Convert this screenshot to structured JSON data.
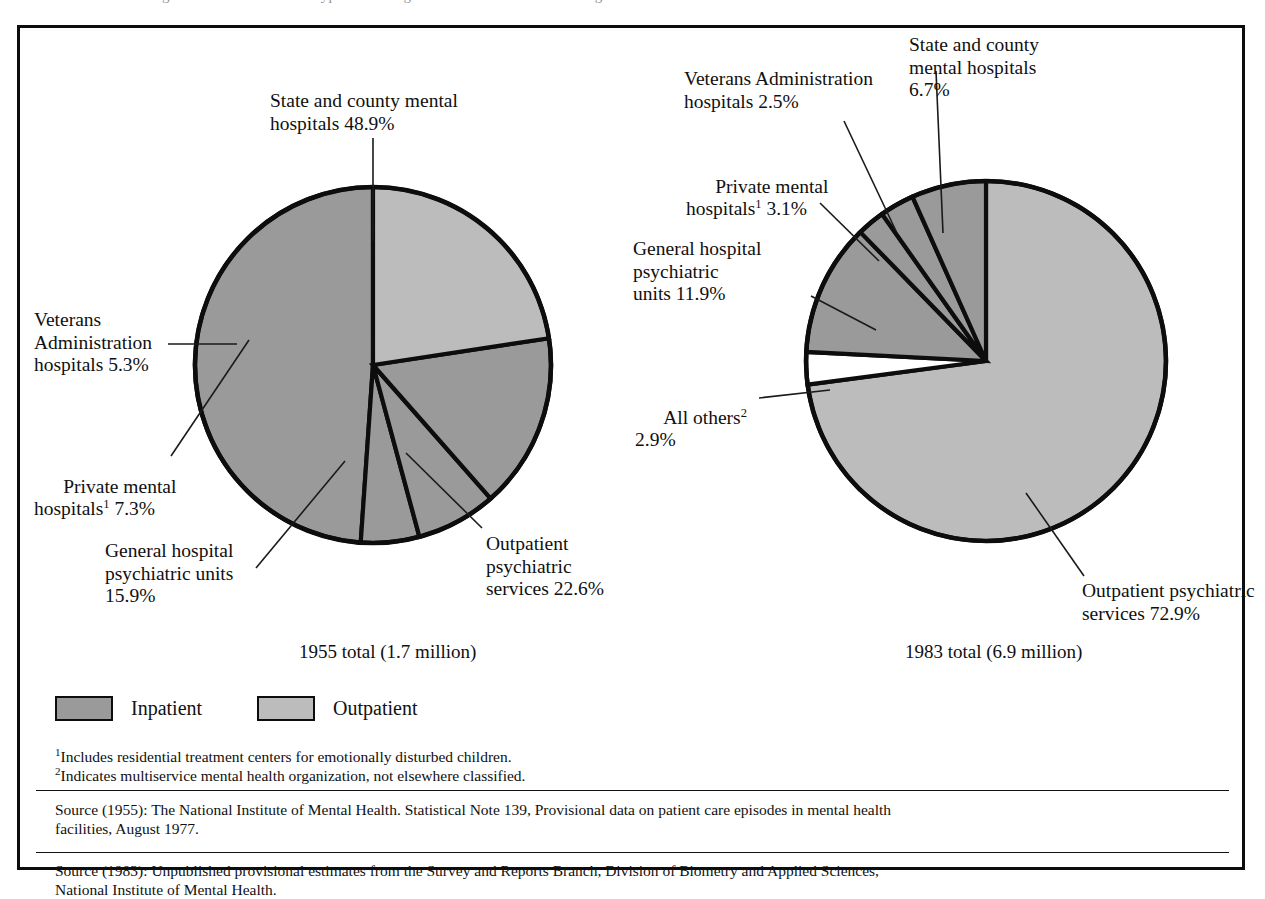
{
  "top_cut_text": "the most dramatic changes have occurred in the types of settings where mental health care is given.",
  "colors": {
    "inpatient": "#9a9a9a",
    "outpatient": "#bcbcbc",
    "other_white": "#ffffff",
    "outline": "#0d0d0d"
  },
  "legend": {
    "items": [
      {
        "label": "Inpatient",
        "swatch": "#9a9a9a"
      },
      {
        "label": "Outpatient",
        "swatch": "#bcbcbc"
      }
    ]
  },
  "totals": {
    "left": "1955 total (1.7 million)",
    "right": "1983 total (6.9 million)"
  },
  "labels_1955": {
    "state_county": "State and county mental\nhospitals 48.9%",
    "veterans": "Veterans\nAdministration\nhospitals 5.3%",
    "private_1": "Private mental\nhospitals",
    "private_2": " 7.3%",
    "general": "General hospital\npsychiatric units\n15.9%",
    "outpatient": "Outpatient\npsychiatric\nservices 22.6%"
  },
  "labels_1983": {
    "state_county": "State and county\nmental hospitals\n6.7%",
    "veterans": "Veterans Administration\nhospitals 2.5%",
    "private_1": "Private mental\nhospitals",
    "private_2": " 3.1%",
    "general": "General hospital\npsychiatric\nunits 11.9%",
    "all_others_1": "All others",
    "all_others_2": "\n2.9%",
    "outpatient": "Outpatient psychiatric\nservices 72.9%"
  },
  "footnotes": {
    "sup1": "1",
    "note1": "Includes residential treatment centers for emotionally disturbed children.",
    "sup2": "2",
    "note2": "Indicates multiservice mental health organization, not elsewhere classified."
  },
  "sources": {
    "s1_line1": "Source (1955):  The National Institute of Mental Health.  Statistical Note 139, Provisional data on patient care episodes in mental health",
    "s1_line2": "facilities, August 1977.",
    "s2_line1": "Source (1983):  Unpublished provisional estimates from the Survey and Reports Branch, Division of Biometry and Applied Sciences,",
    "s2_line2": "National Institute of Mental Health."
  },
  "chart_data": [
    {
      "type": "pie",
      "title": "1955 total (1.7 million)",
      "total_label": "1.7 million",
      "year": 1955,
      "categories": [
        "State and county mental hospitals",
        "Outpatient psychiatric services",
        "General hospital psychiatric units",
        "Private mental hospitals",
        "Veterans Administration hospitals"
      ],
      "values": [
        48.9,
        22.6,
        15.9,
        7.3,
        5.3
      ],
      "units": "percent",
      "groups": [
        "Inpatient",
        "Outpatient",
        "Inpatient",
        "Inpatient",
        "Inpatient"
      ],
      "slice_fills": [
        "#9a9a9a",
        "#bcbcbc",
        "#9a9a9a",
        "#9a9a9a",
        "#9a9a9a"
      ],
      "start_angle_deg": 0,
      "direction": "clockwise"
    },
    {
      "type": "pie",
      "title": "1983 total (6.9 million)",
      "total_label": "6.9 million",
      "year": 1983,
      "categories": [
        "Outpatient psychiatric services",
        "General hospital psychiatric units",
        "State and county mental hospitals",
        "Private mental hospitals",
        "All others",
        "Veterans Administration hospitals"
      ],
      "values": [
        72.9,
        11.9,
        6.7,
        3.1,
        2.9,
        2.5
      ],
      "units": "percent",
      "groups": [
        "Outpatient",
        "Inpatient",
        "Inpatient",
        "Inpatient",
        "Other",
        "Inpatient"
      ],
      "slice_fills": [
        "#bcbcbc",
        "#9a9a9a",
        "#9a9a9a",
        "#9a9a9a",
        "#ffffff",
        "#9a9a9a"
      ],
      "start_angle_deg": 0,
      "direction": "clockwise"
    }
  ]
}
